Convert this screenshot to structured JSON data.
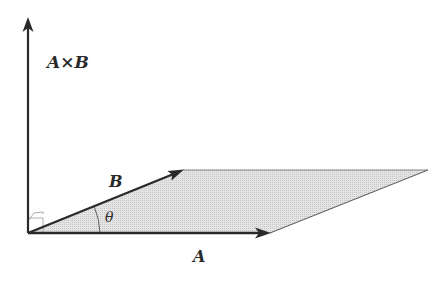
{
  "diagram": {
    "labels": {
      "cross": "A×B",
      "vec_b": "B",
      "angle": "θ",
      "vec_a": "A"
    },
    "colors": {
      "stroke": "#2a2a2a",
      "fill": "#d9d9d9",
      "thin": "#888888"
    },
    "geometry": {
      "origin": [
        28,
        233
      ],
      "a_tip": [
        270,
        233
      ],
      "b_tip": [
        183,
        170
      ],
      "far_corner": [
        428,
        170
      ],
      "cross_tip": [
        28,
        18
      ]
    }
  }
}
